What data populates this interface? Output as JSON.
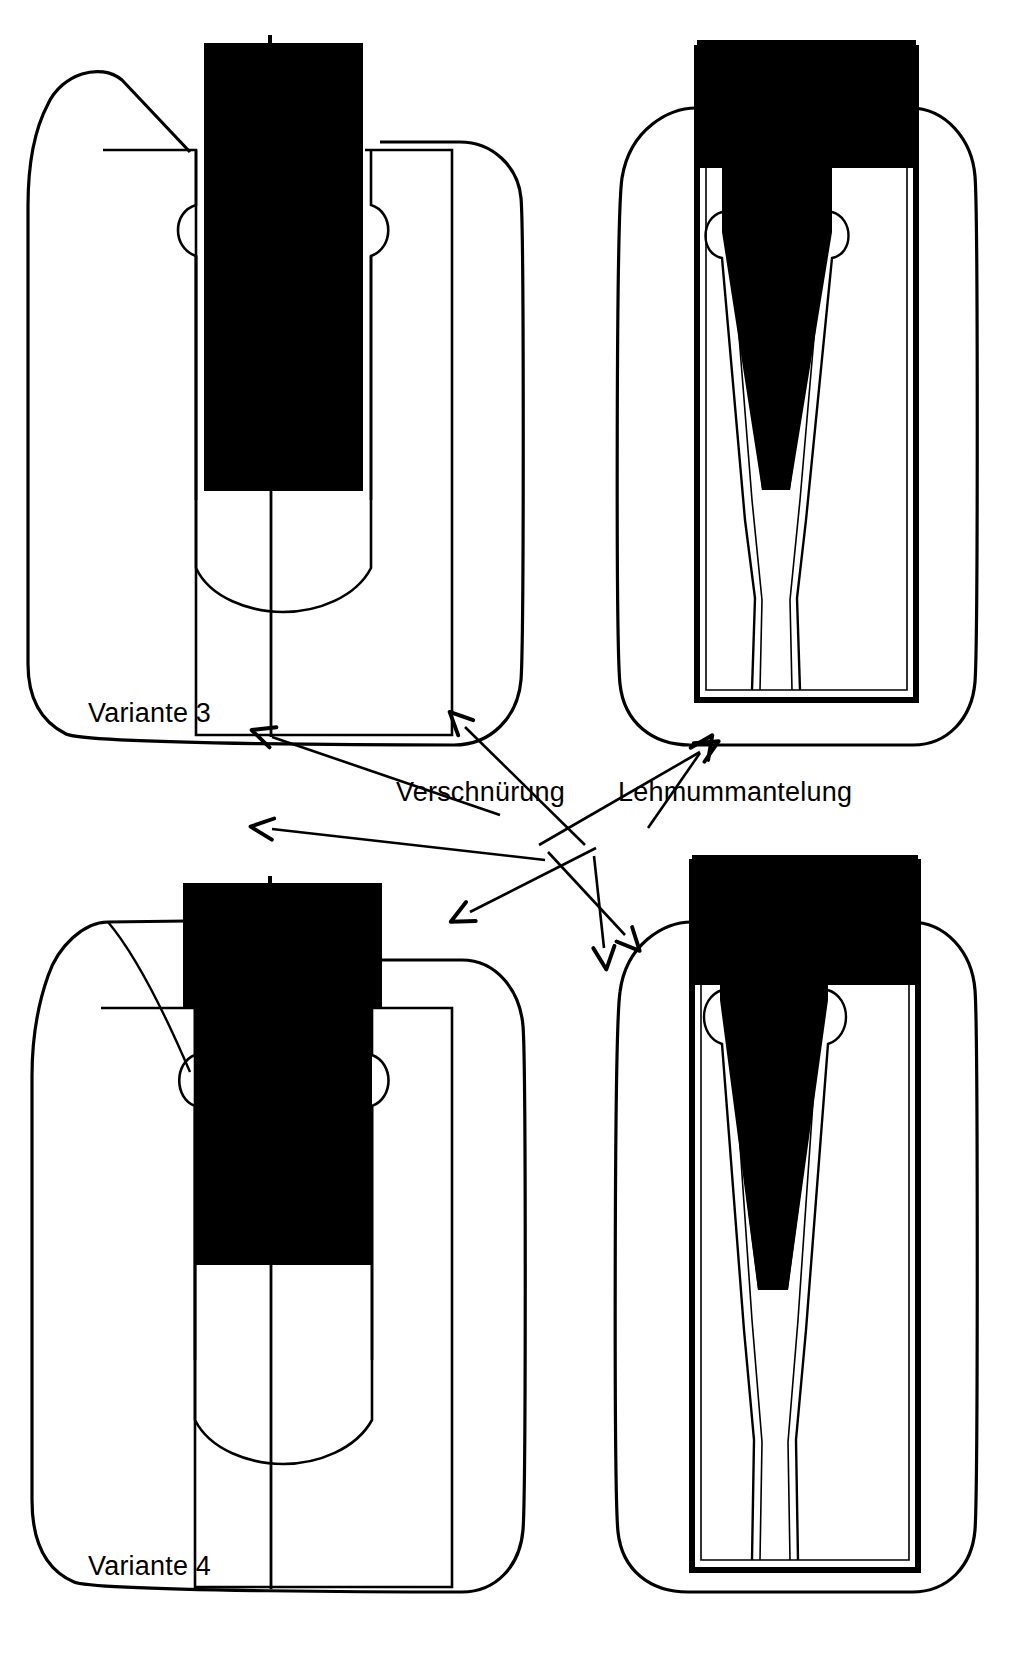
{
  "figure": {
    "language": "de",
    "background_color": "#ffffff",
    "ink_color": "#000000"
  },
  "labels": {
    "variante3": "Variante 3",
    "variante4": "Variante 4",
    "verschnuerung": "Verschnürung",
    "lehmummantelung": "Lehmummantelung"
  },
  "panels": [
    {
      "id": "variant3-front",
      "position": "top-left",
      "caption": "Variante 3",
      "view": "front-view",
      "description": "Rounded outer clay mantle outline with inner rectangular binding and dark vertical blade/shaft"
    },
    {
      "id": "variant3-side",
      "position": "top-right",
      "caption": "",
      "view": "side-view",
      "description": "Rounded outer clay mantle outline with thick-walled rectangular haft and dark V-shaped wedge"
    },
    {
      "id": "variant4-front",
      "position": "bottom-left",
      "caption": "Variante 4",
      "view": "front-view",
      "description": "Rounded outer clay mantle outline with wide dark head and inner rectangular binding"
    },
    {
      "id": "variant4-side",
      "position": "bottom-right",
      "caption": "",
      "view": "side-view",
      "description": "Rounded outer clay mantle outline with thick-walled haft and dark V-shaped wedge"
    }
  ],
  "annotations": [
    {
      "id": "ann-verschnuerung",
      "text": "Verschnürung",
      "arrow_targets": 4
    },
    {
      "id": "ann-lehmummantelung",
      "text": "Lehmummantelung",
      "arrow_targets": 4
    }
  ]
}
